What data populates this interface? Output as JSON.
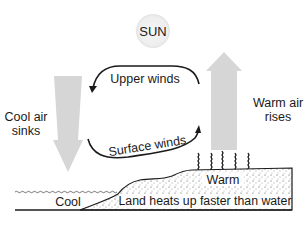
{
  "diagram": {
    "sun": {
      "label": "SUN"
    },
    "labels": {
      "upper_winds": "Upper winds",
      "surface_winds": "Surface winds",
      "cool_air_line1": "Cool air",
      "cool_air_line2": "sinks",
      "warm_air_line1": "Warm air",
      "warm_air_line2": "rises",
      "warm": "Warm",
      "cool": "Cool",
      "land": "Land heats up faster than water"
    },
    "colors": {
      "arrow_fill": "#d4d4d4",
      "sun_fill": "#f2f2f2",
      "line": "#1a1a1a",
      "background": "#ffffff"
    }
  }
}
